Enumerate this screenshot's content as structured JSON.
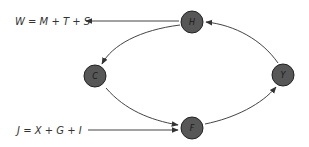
{
  "diagram": {
    "type": "circular-flow",
    "node_fill": "#555555",
    "node_stroke": "#222222",
    "edge_color": "#444444",
    "nodes": [
      {
        "id": "H",
        "label": "H",
        "cx": 192,
        "cy": 22
      },
      {
        "id": "C",
        "label": "C",
        "cx": 95,
        "cy": 76
      },
      {
        "id": "F",
        "label": "F",
        "cx": 192,
        "cy": 128
      },
      {
        "id": "Y",
        "label": "Y",
        "cx": 283,
        "cy": 75
      }
    ],
    "edges": [
      {
        "from": "H",
        "to": "C"
      },
      {
        "from": "C",
        "to": "F"
      },
      {
        "from": "F",
        "to": "Y"
      },
      {
        "from": "Y",
        "to": "H"
      }
    ],
    "equations": {
      "leakage": "W = M + T + S",
      "injection": "J = X + G + I"
    }
  }
}
